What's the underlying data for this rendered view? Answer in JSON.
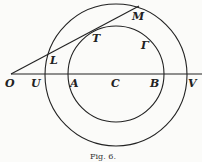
{
  "figure": {
    "caption": "Fig. 6.",
    "labels": {
      "O": "O",
      "U": "U",
      "A": "A",
      "C": "C",
      "B": "B",
      "V": "V",
      "L": "L",
      "T": "T",
      "M": "M",
      "Gamma": "Γ"
    },
    "stroke_color": "#222222",
    "background": "#fbfbf9"
  }
}
